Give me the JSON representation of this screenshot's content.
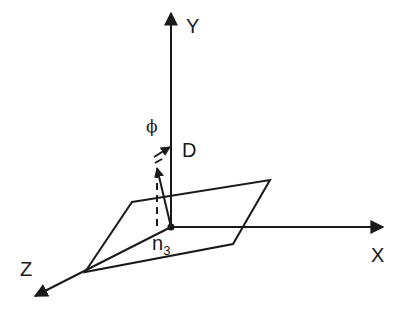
{
  "diagram": {
    "type": "3d-coordinate-axes",
    "colors": {
      "ink": "#1a1a1a",
      "background": "#ffffff"
    },
    "axes": {
      "y": {
        "label": "Y"
      },
      "x": {
        "label": "X"
      },
      "z": {
        "label": "Z"
      }
    },
    "labels": {
      "phi": "ϕ",
      "d": "D",
      "n_base": "n",
      "n_sub": "3"
    },
    "elements": [
      "origin-point",
      "plane",
      "vector-D",
      "vector-n3",
      "dashed-projection"
    ]
  }
}
